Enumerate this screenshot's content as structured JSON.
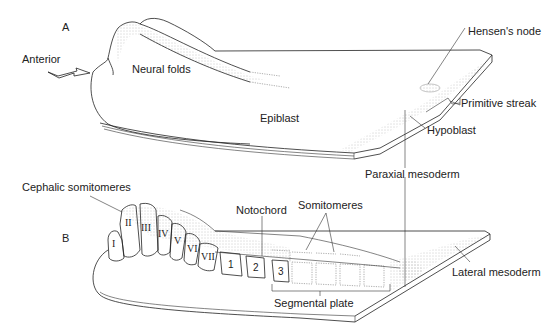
{
  "figure": {
    "panels": [
      {
        "id": "A",
        "label": "A",
        "labels": {
          "anterior": "Anterior",
          "neural_folds": "Neural folds",
          "epiblast": "Epiblast",
          "hensens_node": "Hensen's node",
          "primitive_streak": "Primitive streak",
          "hypoblast": "Hypoblast",
          "paraxial_mesoderm": "Paraxial mesoderm"
        },
        "arrow": "anterior-arrow-icon"
      },
      {
        "id": "B",
        "label": "B",
        "labels": {
          "cephalic_somitomeres": "Cephalic somitomeres",
          "notochord": "Notochord",
          "somitomeres": "Somitomeres",
          "lateral_mesoderm": "Lateral mesoderm",
          "segmental_plate": "Segmental plate"
        },
        "cephalic_numerals": [
          "I",
          "II",
          "III",
          "IV",
          "V",
          "VI",
          "VII"
        ],
        "somite_numbers": [
          "1",
          "2",
          "3"
        ]
      }
    ]
  }
}
